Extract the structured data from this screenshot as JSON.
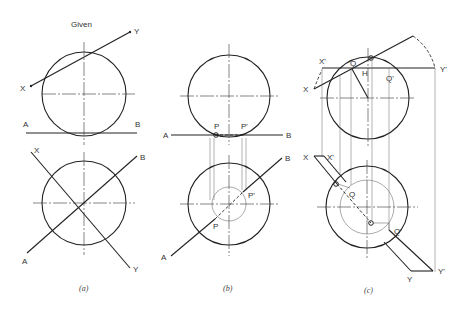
{
  "figure": {
    "title": "Given",
    "panels": [
      {
        "id": "a",
        "caption": "(a)",
        "labels": {
          "x_top": "X",
          "y_top": "Y",
          "a_top": "A",
          "b_top": "B",
          "x_bot": "X",
          "y_bot": "Y",
          "a_bot": "A",
          "b_bot": "B"
        }
      },
      {
        "id": "b",
        "caption": "(b)",
        "labels": {
          "a_top": "A",
          "b_top": "B",
          "p_top": "P",
          "pp_top": "P'",
          "a_bot": "A",
          "b_bot": "B",
          "p_bot": "P",
          "pp_bot": "P'"
        }
      },
      {
        "id": "c",
        "caption": "(c)",
        "labels": {
          "x_top": "X",
          "xp_top": "X'",
          "yp_top": "Y'",
          "q_top": "Q",
          "qp_top": "Q'",
          "h_top": "H",
          "x_bot": "X",
          "xp_bot": "X'",
          "y_bot": "Y",
          "yp_bot": "Y'",
          "q_bot": "Q",
          "qp_bot": "Q'"
        }
      }
    ]
  }
}
